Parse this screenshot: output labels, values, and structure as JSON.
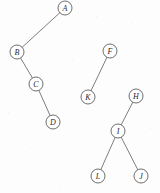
{
  "figure": {
    "width": 160,
    "height": 193,
    "background_color": "#fdfdfd",
    "node_fill_color": "#ffffff",
    "node_stroke_color": "#4a4a4a",
    "edge_stroke_color": "#5d5d5d",
    "label_color": "#2a2a2a",
    "node_radius": 7
  },
  "chart_data": {
    "type": "diagram",
    "diagram_type": "tree-forest",
    "nodes": [
      {
        "id": "A",
        "label": "A",
        "x": 65,
        "y": 8
      },
      {
        "id": "B",
        "label": "B",
        "x": 17,
        "y": 52
      },
      {
        "id": "C",
        "label": "C",
        "x": 36,
        "y": 84
      },
      {
        "id": "D",
        "label": "D",
        "x": 53,
        "y": 122
      },
      {
        "id": "F",
        "label": "F",
        "x": 110,
        "y": 51
      },
      {
        "id": "K",
        "label": "K",
        "x": 88,
        "y": 97
      },
      {
        "id": "H",
        "label": "H",
        "x": 136,
        "y": 96
      },
      {
        "id": "I",
        "label": "I",
        "x": 118,
        "y": 131
      },
      {
        "id": "L",
        "label": "L",
        "x": 98,
        "y": 176
      },
      {
        "id": "J",
        "label": "J",
        "x": 141,
        "y": 176
      }
    ],
    "edges": [
      {
        "from": "A",
        "to": "B"
      },
      {
        "from": "B",
        "to": "C"
      },
      {
        "from": "C",
        "to": "D"
      },
      {
        "from": "F",
        "to": "K"
      },
      {
        "from": "H",
        "to": "I"
      },
      {
        "from": "I",
        "to": "L"
      },
      {
        "from": "I",
        "to": "J"
      }
    ],
    "components": [
      {
        "root": "A",
        "members": [
          "A",
          "B",
          "C",
          "D"
        ]
      },
      {
        "root": "F",
        "members": [
          "F",
          "K"
        ]
      },
      {
        "root": "H",
        "members": [
          "H",
          "I",
          "L",
          "J"
        ]
      }
    ]
  },
  "speckles": [
    {
      "x": 14,
      "y": 10,
      "size": 1
    },
    {
      "x": 132,
      "y": 22,
      "size": 1
    },
    {
      "x": 30,
      "y": 148,
      "size": 1
    },
    {
      "x": 72,
      "y": 60,
      "size": 1
    },
    {
      "x": 150,
      "y": 128,
      "size": 1
    },
    {
      "x": 8,
      "y": 112,
      "size": 1
    },
    {
      "x": 96,
      "y": 16,
      "size": 1
    },
    {
      "x": 60,
      "y": 186,
      "size": 1
    }
  ]
}
